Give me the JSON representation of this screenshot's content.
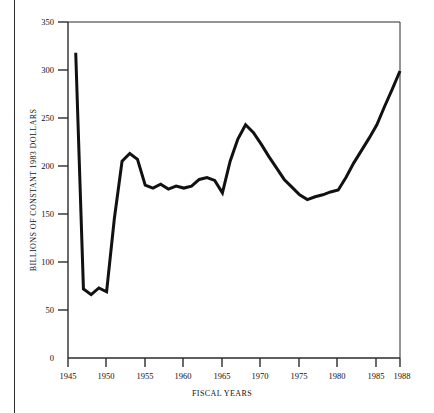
{
  "chart_data": {
    "type": "line",
    "title": "",
    "subtitle": "",
    "xlabel": "FISCAL YEARS",
    "ylabel": "BILLIONS OF CONSTANT 1983 DOLLARS",
    "xlim": [
      1945,
      1988
    ],
    "ylim": [
      0,
      350
    ],
    "xticks": [
      1945,
      1950,
      1955,
      1960,
      1965,
      1970,
      1975,
      1980,
      1985,
      1988
    ],
    "xtick_labels": [
      "1945",
      "1950",
      "1955",
      "1960",
      "1965",
      "1970",
      "1975",
      "1980",
      "1985",
      "1988"
    ],
    "yticks": [
      0,
      50,
      100,
      150,
      200,
      250,
      300,
      350
    ],
    "ytick_labels": [
      "0",
      "50",
      "100",
      "150",
      "200",
      "250",
      "300",
      "350"
    ],
    "grid": false,
    "legend": null,
    "legend_position": "none",
    "line_color": "#111111",
    "line_width": 3,
    "x": [
      1946,
      1947,
      1948,
      1949,
      1950,
      1951,
      1952,
      1953,
      1954,
      1955,
      1956,
      1957,
      1958,
      1959,
      1960,
      1961,
      1962,
      1963,
      1964,
      1965,
      1966,
      1967,
      1968,
      1969,
      1970,
      1971,
      1972,
      1973,
      1974,
      1975,
      1976,
      1977,
      1978,
      1979,
      1980,
      1981,
      1982,
      1983,
      1984,
      1985,
      1986,
      1987,
      1988
    ],
    "values": [
      318,
      72,
      66,
      73,
      69,
      145,
      205,
      213,
      207,
      180,
      177,
      181,
      176,
      179,
      177,
      179,
      186,
      188,
      185,
      172,
      205,
      228,
      243,
      235,
      223,
      210,
      198,
      186,
      178,
      170,
      165,
      168,
      170,
      173,
      175,
      188,
      203,
      216,
      229,
      243,
      262,
      280,
      299
    ],
    "series": [
      {
        "name": "U.S. defense budget authority",
        "values": [
          318,
          72,
          66,
          73,
          69,
          145,
          205,
          213,
          207,
          180,
          177,
          181,
          176,
          179,
          177,
          179,
          186,
          188,
          185,
          172,
          205,
          228,
          243,
          235,
          223,
          210,
          198,
          186,
          178,
          170,
          165,
          168,
          170,
          173,
          175,
          188,
          203,
          216,
          229,
          243,
          262,
          280,
          299
        ]
      }
    ],
    "annotations": []
  },
  "axes": {
    "y_title": "BILLIONS OF CONSTANT 1983 DOLLARS",
    "x_title": "FISCAL YEARS"
  }
}
